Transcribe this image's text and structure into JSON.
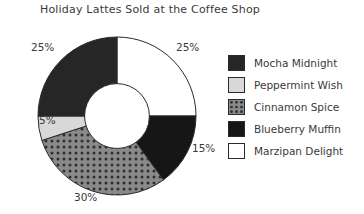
{
  "chart_data": {
    "type": "pie",
    "variant": "donut",
    "title": "Holiday Lattes Sold at the Coffee Shop",
    "xlabel": "",
    "ylabel": "",
    "categories": [
      "Marzipan Delight",
      "Blueberry Muffin",
      "Cinnamon Spice",
      "Peppermint Wish",
      "Mocha Midnight"
    ],
    "values": [
      25,
      15,
      30,
      5,
      25
    ],
    "value_unit": "%",
    "start_angle_deg": 0,
    "direction": "clockwise",
    "inner_radius_ratio": 0.41,
    "legend_position": "right",
    "grid": false,
    "slices": [
      {
        "label": "Marzipan Delight",
        "value": 25,
        "display": "25%",
        "fill": "#ffffff",
        "pattern": "solid",
        "start_deg": 0,
        "end_deg": 90,
        "label_pos": "top-right"
      },
      {
        "label": "Blueberry Muffin",
        "value": 15,
        "display": "15%",
        "fill": "#161616",
        "pattern": "solid",
        "start_deg": 90,
        "end_deg": 144,
        "label_pos": "right"
      },
      {
        "label": "Cinnamon Spice",
        "value": 30,
        "display": "30%",
        "fill": "#8a8a8a",
        "pattern": "dots",
        "dot_color": "#2e2e2e",
        "start_deg": 144,
        "end_deg": 252,
        "label_pos": "bottom"
      },
      {
        "label": "Peppermint Wish",
        "value": 5,
        "display": "5%",
        "fill": "#d8d8d8",
        "pattern": "solid",
        "start_deg": 252,
        "end_deg": 270,
        "label_pos": "left"
      },
      {
        "label": "Mocha Midnight",
        "value": 25,
        "display": "25%",
        "fill": "#262626",
        "pattern": "solid",
        "start_deg": 270,
        "end_deg": 360,
        "label_pos": "top-left"
      }
    ]
  },
  "legend": {
    "items": [
      {
        "label": "Mocha Midnight",
        "swatch": "#262626",
        "pattern": "solid"
      },
      {
        "label": "Peppermint Wish",
        "swatch": "#d8d8d8",
        "pattern": "solid"
      },
      {
        "label": "Cinnamon Spice",
        "swatch": "#8a8a8a",
        "pattern": "dots"
      },
      {
        "label": "Blueberry Muffin",
        "swatch": "#161616",
        "pattern": "solid"
      },
      {
        "label": "Marzipan Delight",
        "swatch": "#ffffff",
        "pattern": "solid"
      }
    ]
  },
  "colors": {
    "outline": "#2a2a2a",
    "text": "#3a3a3a",
    "background": "#ffffff"
  }
}
